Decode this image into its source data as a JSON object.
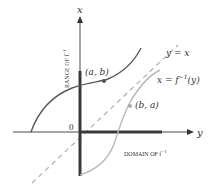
{
  "diagram": {
    "axes": {
      "vertical_label": "x",
      "horizontal_label": "y",
      "origin_label": "0"
    },
    "labels": {
      "range": "RANGE OF f",
      "range_sup": "−1",
      "domain": "DOMAIN OF f",
      "domain_sup": "−1",
      "point_ab": "(a, b)",
      "point_ba": "(b, a)",
      "line_identity": "y = x",
      "inverse_curve": "x = f",
      "inverse_sup": "−1",
      "inverse_tail": "(y)"
    },
    "colors": {
      "axis": "#4a4a4a",
      "thick_segment": "#3a3a3a",
      "curve_f": "#5a5a5a",
      "curve_inverse": "#b8b8b8",
      "dashed_line": "#b0b0b0",
      "text": "#333333"
    }
  }
}
